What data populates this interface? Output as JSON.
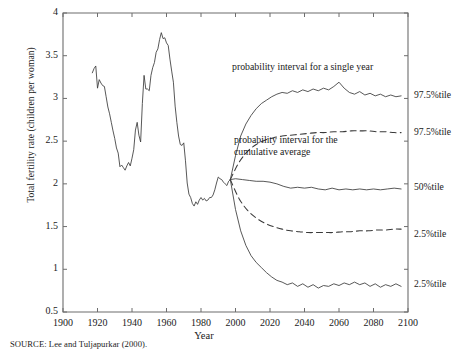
{
  "chart_data": {
    "type": "line",
    "title": "",
    "xlabel": "Year",
    "ylabel": "Total fertility rate (children per woman)",
    "xlim": [
      1900,
      2100
    ],
    "ylim": [
      0.5,
      4
    ],
    "xticks": [
      "1900",
      "1920",
      "1940",
      "1960",
      "1980",
      "2000",
      "2020",
      "2040",
      "2060",
      "2080",
      "2100"
    ],
    "yticks": [
      "0.5",
      "1",
      "1.5",
      "2",
      "2.5",
      "3",
      "3.5",
      "4"
    ],
    "grid": false,
    "legend_position": "right-outside",
    "source": "SOURCE: Lee and Tuljapurkar (2000).",
    "annotations": [
      {
        "name": "probability-interval-single-year",
        "text": "probability interval for a single year",
        "x": 2022,
        "y": 3.27
      },
      {
        "name": "probability-interval-cumulative-average",
        "line1": "probability interval for the",
        "line2": "cumulative average",
        "x": 2024,
        "y": 2.45
      }
    ],
    "right_labels": [
      {
        "name": "upper-single-year",
        "text": "97.5%tile",
        "y": 3.03
      },
      {
        "name": "upper-cumulative",
        "text": "97.5%tile",
        "y": 2.6
      },
      {
        "name": "median",
        "text": "50%tile",
        "y": 1.95
      },
      {
        "name": "lower-cumulative",
        "text": "2.5%tile",
        "y": 1.4
      },
      {
        "name": "lower-single-year",
        "text": "2.5%tile",
        "y": 0.82
      }
    ],
    "series": [
      {
        "name": "historical",
        "style": "solid",
        "x": [
          1917,
          1918,
          1919,
          1920,
          1921,
          1922,
          1923,
          1924,
          1925,
          1926,
          1927,
          1928,
          1929,
          1930,
          1931,
          1932,
          1933,
          1934,
          1935,
          1936,
          1937,
          1938,
          1939,
          1940,
          1941,
          1942,
          1943,
          1944,
          1945,
          1946,
          1947,
          1948,
          1949,
          1950,
          1951,
          1952,
          1953,
          1954,
          1955,
          1956,
          1957,
          1958,
          1959,
          1960,
          1961,
          1962,
          1963,
          1964,
          1965,
          1966,
          1967,
          1968,
          1969,
          1970,
          1971,
          1972,
          1973,
          1974,
          1975,
          1976,
          1977,
          1978,
          1979,
          1980,
          1981,
          1982,
          1983,
          1984,
          1985,
          1986,
          1987,
          1988,
          1989,
          1990,
          1991,
          1992,
          1993,
          1994,
          1995,
          1996,
          1997
        ],
        "values": [
          3.3,
          3.35,
          3.38,
          3.12,
          3.22,
          3.18,
          3.15,
          3.14,
          3.02,
          2.9,
          2.82,
          2.72,
          2.62,
          2.53,
          2.42,
          2.36,
          2.2,
          2.22,
          2.19,
          2.16,
          2.21,
          2.25,
          2.21,
          2.3,
          2.4,
          2.63,
          2.72,
          2.57,
          2.49,
          2.94,
          3.27,
          3.11,
          3.11,
          3.09,
          3.27,
          3.36,
          3.42,
          3.54,
          3.58,
          3.69,
          3.77,
          3.7,
          3.71,
          3.65,
          3.62,
          3.46,
          3.32,
          3.19,
          2.91,
          2.72,
          2.56,
          2.46,
          2.45,
          2.48,
          2.27,
          2.01,
          1.88,
          1.84,
          1.77,
          1.74,
          1.79,
          1.76,
          1.81,
          1.84,
          1.81,
          1.83,
          1.8,
          1.81,
          1.84,
          1.84,
          1.87,
          1.93,
          2.01,
          2.08,
          2.06,
          2.05,
          2.02,
          2.0,
          1.98,
          2.03,
          2.05
        ]
      },
      {
        "name": "97.5-percentile-single-year",
        "style": "solid",
        "x": [
          1997,
          2000,
          2003,
          2006,
          2009,
          2012,
          2015,
          2018,
          2021,
          2024,
          2027,
          2030,
          2033,
          2036,
          2039,
          2042,
          2045,
          2048,
          2051,
          2054,
          2057,
          2060,
          2063,
          2066,
          2069,
          2072,
          2075,
          2078,
          2081,
          2084,
          2087,
          2090,
          2093,
          2096
        ],
        "values": [
          2.05,
          2.33,
          2.56,
          2.7,
          2.8,
          2.88,
          2.94,
          2.98,
          3.02,
          3.05,
          3.07,
          3.06,
          3.09,
          3.07,
          3.1,
          3.08,
          3.11,
          3.09,
          3.12,
          3.1,
          3.14,
          3.19,
          3.12,
          3.07,
          3.05,
          3.08,
          3.04,
          3.06,
          3.03,
          3.05,
          3.02,
          3.04,
          3.02,
          3.03
        ]
      },
      {
        "name": "97.5-percentile-cumulative-average",
        "style": "dashed",
        "x": [
          1997,
          2002,
          2007,
          2012,
          2017,
          2022,
          2027,
          2032,
          2037,
          2042,
          2047,
          2052,
          2057,
          2062,
          2067,
          2072,
          2077,
          2082,
          2087,
          2092,
          2096
        ],
        "values": [
          2.05,
          2.25,
          2.38,
          2.46,
          2.51,
          2.54,
          2.56,
          2.57,
          2.58,
          2.59,
          2.6,
          2.6,
          2.61,
          2.61,
          2.62,
          2.62,
          2.62,
          2.61,
          2.61,
          2.6,
          2.6
        ]
      },
      {
        "name": "50-percentile",
        "style": "solid",
        "x": [
          1997,
          2000,
          2004,
          2008,
          2012,
          2016,
          2020,
          2024,
          2028,
          2032,
          2036,
          2040,
          2044,
          2048,
          2052,
          2056,
          2060,
          2064,
          2068,
          2072,
          2076,
          2080,
          2084,
          2088,
          2092,
          2096
        ],
        "values": [
          2.05,
          2.06,
          2.05,
          2.04,
          2.03,
          2.03,
          2.02,
          2.0,
          1.97,
          1.95,
          1.96,
          1.95,
          1.96,
          1.94,
          1.93,
          1.95,
          1.93,
          1.94,
          1.93,
          1.94,
          1.93,
          1.94,
          1.93,
          1.94,
          1.95,
          1.94
        ]
      },
      {
        "name": "2.5-percentile-cumulative-average",
        "style": "dashed",
        "x": [
          1997,
          2002,
          2007,
          2012,
          2017,
          2022,
          2027,
          2032,
          2037,
          2042,
          2047,
          2052,
          2057,
          2062,
          2067,
          2072,
          2077,
          2082,
          2087,
          2092,
          2096
        ],
        "values": [
          2.05,
          1.83,
          1.69,
          1.6,
          1.54,
          1.5,
          1.47,
          1.45,
          1.44,
          1.43,
          1.43,
          1.43,
          1.43,
          1.44,
          1.44,
          1.45,
          1.45,
          1.46,
          1.46,
          1.47,
          1.47
        ]
      },
      {
        "name": "2.5-percentile-single-year",
        "style": "solid",
        "x": [
          1997,
          2000,
          2003,
          2006,
          2009,
          2012,
          2015,
          2018,
          2021,
          2024,
          2027,
          2030,
          2033,
          2036,
          2039,
          2042,
          2045,
          2048,
          2051,
          2054,
          2057,
          2060,
          2063,
          2066,
          2069,
          2072,
          2075,
          2078,
          2081,
          2084,
          2087,
          2090,
          2093,
          2096
        ],
        "values": [
          2.05,
          1.7,
          1.45,
          1.28,
          1.16,
          1.08,
          1.02,
          0.96,
          0.91,
          0.87,
          0.85,
          0.82,
          0.84,
          0.8,
          0.83,
          0.79,
          0.82,
          0.78,
          0.81,
          0.8,
          0.83,
          0.81,
          0.84,
          0.82,
          0.85,
          0.82,
          0.84,
          0.8,
          0.83,
          0.79,
          0.82,
          0.8,
          0.83,
          0.8
        ]
      }
    ]
  },
  "axis": {
    "ylabel_text": "Total fertility rate (children per woman)",
    "xlabel_text": "Year"
  },
  "footer": {
    "source_text": "SOURCE: Lee and Tuljapurkar (2000)."
  }
}
